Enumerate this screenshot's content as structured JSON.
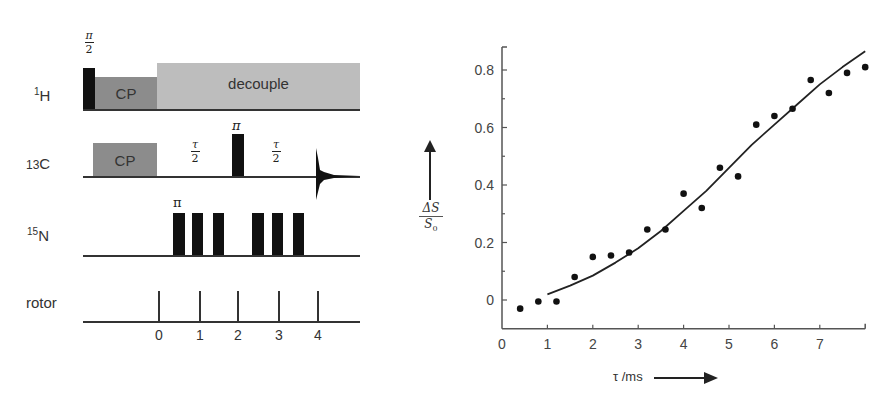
{
  "pulse_sequence": {
    "channels": [
      {
        "id": "1H",
        "mass": "1",
        "element": "H"
      },
      {
        "id": "13C",
        "mass": "13",
        "element": "C"
      },
      {
        "id": "15N",
        "mass": "15",
        "element": "N"
      },
      {
        "id": "rotor",
        "label": "rotor"
      }
    ],
    "h_channel": {
      "excitation_pulse_label_num": "π",
      "excitation_pulse_label_den": "2",
      "cp_label": "CP",
      "decouple_label": "decouple"
    },
    "c_channel": {
      "cp_label": "CP",
      "tau_half_1_num": "τ",
      "tau_half_1_den": "2",
      "refocus_pulse_label": "π",
      "tau_half_2_num": "τ",
      "tau_half_2_den": "2"
    },
    "n_channel": {
      "first_pulse_label": "π",
      "pulse_count": 6
    },
    "rotor_channel": {
      "period_labels": [
        "0",
        "1",
        "2",
        "3",
        "4"
      ]
    },
    "colors": {
      "pulse": "#111111",
      "cp_block": "#8c8c8c",
      "decouple_block": "#bdbdbd",
      "baseline": "#333333"
    }
  },
  "chart_data": {
    "type": "scatter",
    "title": "",
    "xlabel": "τ /ms",
    "ylabel": "ΔS / S0",
    "xlim": [
      0,
      8
    ],
    "ylim": [
      -0.1,
      0.88
    ],
    "x_ticks": [
      "0",
      "1",
      "2",
      "3",
      "4",
      "5",
      "6",
      "7"
    ],
    "y_ticks": [
      "0",
      "0.2",
      "0.4",
      "0.6",
      "0.8"
    ],
    "grid": false,
    "legend": null,
    "series": [
      {
        "name": "experimental",
        "style": "points",
        "x": [
          0.4,
          0.8,
          1.2,
          1.6,
          2.0,
          2.4,
          2.8,
          3.2,
          3.6,
          4.0,
          4.4,
          4.8,
          5.2,
          5.6,
          6.0,
          6.4,
          6.8,
          7.2,
          7.6,
          8.0
        ],
        "y": [
          -0.03,
          -0.005,
          -0.005,
          0.08,
          0.15,
          0.155,
          0.165,
          0.245,
          0.245,
          0.37,
          0.32,
          0.46,
          0.43,
          0.61,
          0.64,
          0.665,
          0.765,
          0.72,
          0.79,
          0.81
        ]
      },
      {
        "name": "simulated fit",
        "style": "line",
        "x": [
          1.0,
          1.5,
          2.0,
          2.5,
          3.0,
          3.5,
          4.0,
          4.5,
          5.0,
          5.5,
          6.0,
          6.5,
          7.0,
          7.5,
          8.0
        ],
        "y": [
          0.02,
          0.05,
          0.085,
          0.13,
          0.18,
          0.24,
          0.31,
          0.38,
          0.46,
          0.54,
          0.61,
          0.68,
          0.75,
          0.81,
          0.865
        ]
      }
    ],
    "colors": {
      "points": "#111111",
      "line": "#222222",
      "axis": "#555555"
    }
  }
}
